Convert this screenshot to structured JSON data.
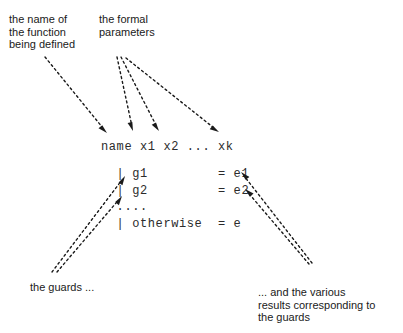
{
  "diagram": {
    "background_color": "#ffffff",
    "ink_color": "#1a1a1a",
    "code_color": "#2b2b2b"
  },
  "labels": {
    "name_of_function": "the name of\nthe function\nbeing defined",
    "formal_parameters": "the formal\nparameters",
    "the_guards": "the guards ...",
    "the_results": "... and the various\nresults corresponding to\nthe guards"
  },
  "code": {
    "signature": "name x1 x2 ... xk",
    "guards_block": "  | g1         = e1\n  | g2         = e2\n  ....\n  | otherwise  = e",
    "signature_tokens": [
      "name",
      "x1",
      "x2",
      "...",
      "xk"
    ],
    "guard_rows": [
      {
        "bar": "|",
        "guard": "g1",
        "eq": "=",
        "result": "e1"
      },
      {
        "bar": "|",
        "guard": "g2",
        "eq": "=",
        "result": "e2"
      },
      {
        "bar": "",
        "guard": "....",
        "eq": "",
        "result": ""
      },
      {
        "bar": "|",
        "guard": "otherwise",
        "eq": "=",
        "result": "e"
      }
    ]
  },
  "arrows": [
    {
      "name": "arrow-to-name",
      "from": [
        45,
        57
      ],
      "to": [
        107,
        133
      ]
    },
    {
      "name": "arrow-to-x1",
      "from": [
        117,
        57
      ],
      "to": [
        133,
        131
      ]
    },
    {
      "name": "arrow-to-x2",
      "from": [
        121,
        57
      ],
      "to": [
        159,
        131
      ]
    },
    {
      "name": "arrow-to-xk",
      "from": [
        126,
        58
      ],
      "to": [
        219,
        132
      ]
    },
    {
      "name": "arrow-to-guard-g1",
      "from": [
        52,
        272
      ],
      "to": [
        125,
        176
      ]
    },
    {
      "name": "arrow-to-guard-g2",
      "from": [
        57,
        272
      ],
      "to": [
        122,
        196
      ]
    },
    {
      "name": "arrow-to-result-e1",
      "from": [
        312,
        263
      ],
      "to": [
        241,
        172
      ]
    },
    {
      "name": "arrow-to-result-e2",
      "from": [
        309,
        264
      ],
      "to": [
        245,
        189
      ]
    }
  ]
}
